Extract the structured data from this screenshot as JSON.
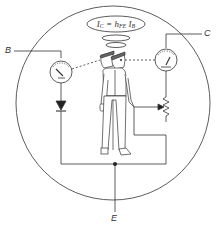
{
  "diagram": {
    "formula": {
      "lhs": "I",
      "lhs_sub": "C",
      "equals": " = ",
      "gain": "h",
      "gain_sub": "FE",
      "rhs": " I",
      "rhs_sub": "B"
    },
    "terminals": {
      "base": "B",
      "collector": "C",
      "emitter": "E"
    },
    "components": [
      "base-current-meter",
      "collector-current-meter",
      "diode",
      "variable-resistor",
      "emitter-junction-node"
    ],
    "figure": "two-faced man (transistor personified) adjusting variable resistor",
    "colors": {
      "line": "#333333",
      "background": "#ffffff"
    }
  }
}
